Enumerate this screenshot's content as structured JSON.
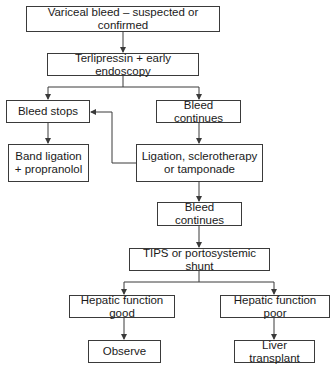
{
  "diagram": {
    "type": "flowchart",
    "nodes": [
      {
        "id": "n1",
        "label": "Variceal bleed – suspected or confirmed"
      },
      {
        "id": "n2",
        "label": "Terlipressin + early endoscopy"
      },
      {
        "id": "n3",
        "label": "Bleed stops"
      },
      {
        "id": "n4",
        "label": "Bleed continues"
      },
      {
        "id": "n5",
        "label": "Band ligation + propranolol"
      },
      {
        "id": "n6",
        "label": "Ligation, sclerotherapy or tamponade"
      },
      {
        "id": "n7",
        "label": "Bleed continues"
      },
      {
        "id": "n8",
        "label": "TIPS or portosystemic shunt"
      },
      {
        "id": "n9",
        "label": "Hepatic function good"
      },
      {
        "id": "n10",
        "label": "Hepatic function poor"
      },
      {
        "id": "n11",
        "label": "Observe"
      },
      {
        "id": "n12",
        "label": "Liver transplant"
      }
    ],
    "edges": [
      [
        "n1",
        "n2"
      ],
      [
        "n2",
        "n3"
      ],
      [
        "n2",
        "n4"
      ],
      [
        "n3",
        "n5"
      ],
      [
        "n4",
        "n6"
      ],
      [
        "n6",
        "n3"
      ],
      [
        "n6",
        "n7"
      ],
      [
        "n7",
        "n8"
      ],
      [
        "n8",
        "n9"
      ],
      [
        "n8",
        "n10"
      ],
      [
        "n9",
        "n11"
      ],
      [
        "n10",
        "n12"
      ]
    ],
    "line_color": "#3a3a3a"
  }
}
